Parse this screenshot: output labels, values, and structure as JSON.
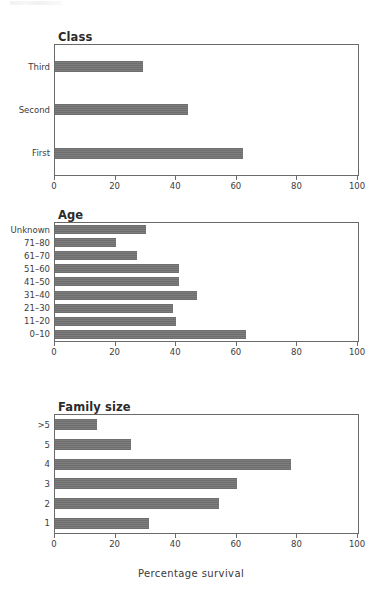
{
  "figure": {
    "axis_title": "Percentage survival",
    "bar_color": "#6e6e6e",
    "axis_color": "#6a6a6a"
  },
  "chart_data": [
    {
      "type": "bar",
      "orientation": "horizontal",
      "title": "Class",
      "xlabel": "",
      "ylabel": "",
      "xlim": [
        0,
        100
      ],
      "xticks": [
        0,
        20,
        40,
        60,
        80,
        100
      ],
      "grid": false,
      "legend": "none",
      "categories": [
        "Third",
        "Second",
        "First"
      ],
      "values": [
        29,
        44,
        62
      ]
    },
    {
      "type": "bar",
      "orientation": "horizontal",
      "title": "Age",
      "xlabel": "",
      "ylabel": "",
      "xlim": [
        0,
        100
      ],
      "xticks": [
        0,
        20,
        40,
        60,
        80,
        100
      ],
      "grid": false,
      "legend": "none",
      "categories": [
        "Unknown",
        "71–80",
        "61–70",
        "51–60",
        "41–50",
        "31–40",
        "21–30",
        "11–20",
        "0–10"
      ],
      "values": [
        30,
        20,
        27,
        41,
        41,
        47,
        39,
        40,
        63
      ]
    },
    {
      "type": "bar",
      "orientation": "horizontal",
      "title": "Family size",
      "xlabel": "Percentage survival",
      "ylabel": "",
      "xlim": [
        0,
        100
      ],
      "xticks": [
        0,
        20,
        40,
        60,
        80,
        100
      ],
      "grid": false,
      "legend": "none",
      "categories": [
        ">5",
        "5",
        "4",
        "3",
        "2",
        "1"
      ],
      "values": [
        14,
        25,
        78,
        60,
        54,
        31
      ]
    }
  ]
}
